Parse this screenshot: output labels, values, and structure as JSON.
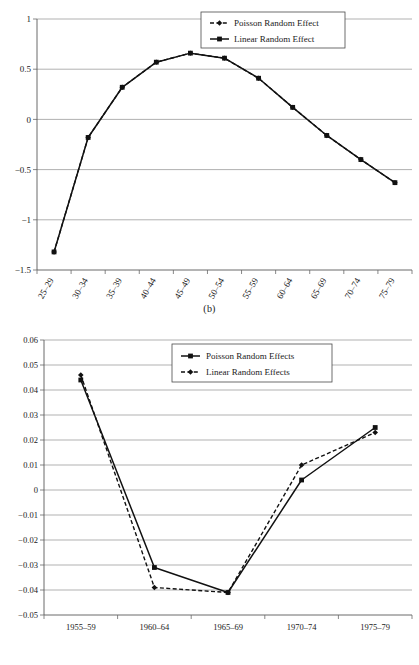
{
  "figures": [
    {
      "id": "b",
      "caption": "(b)",
      "legend": {
        "entries": [
          {
            "label": "Poisson Random Effect",
            "style": "dashed-diamond"
          },
          {
            "label": "Linear Random Effect",
            "style": "solid-square"
          }
        ]
      }
    },
    {
      "id": "c",
      "caption": "(c)",
      "legend": {
        "entries": [
          {
            "label": "Poisson Random Effects",
            "style": "solid-square"
          },
          {
            "label": "Linear Random Effects",
            "style": "dashed-diamond"
          }
        ]
      }
    }
  ],
  "chart_data": [
    {
      "type": "line",
      "id": "b",
      "title": "",
      "caption": "(b)",
      "xlabel": "",
      "ylabel": "",
      "categories": [
        "25–29",
        "30–34",
        "35–39",
        "40–44",
        "45–49",
        "50–54",
        "55–59",
        "60–64",
        "65–69",
        "70–74",
        "75–79"
      ],
      "ylim": [
        -1.5,
        1
      ],
      "yticks": [
        1,
        0.5,
        0,
        -0.5,
        -1,
        -1.5
      ],
      "ytick_labels": [
        "1",
        "0.5",
        "0",
        "−0.5",
        "−1",
        "−1.5"
      ],
      "grid": true,
      "legend_position": "top-right",
      "series": [
        {
          "name": "Poisson Random Effect",
          "marker": "diamond",
          "line": "dashed",
          "values": [
            -1.32,
            -0.18,
            0.32,
            0.57,
            0.66,
            0.61,
            0.41,
            0.12,
            -0.16,
            -0.4,
            -0.63
          ]
        },
        {
          "name": "Linear Random Effect",
          "marker": "square",
          "line": "solid",
          "values": [
            -1.32,
            -0.18,
            0.32,
            0.57,
            0.66,
            0.61,
            0.41,
            0.12,
            -0.16,
            -0.4,
            -0.63
          ]
        }
      ]
    },
    {
      "type": "line",
      "id": "c",
      "title": "",
      "caption": "(c)",
      "xlabel": "",
      "ylabel": "",
      "categories": [
        "1955–59",
        "1960–64",
        "1965–69",
        "1970–74",
        "1975–79"
      ],
      "ylim": [
        -0.05,
        0.06
      ],
      "yticks": [
        0.06,
        0.05,
        0.04,
        0.03,
        0.02,
        0.01,
        0,
        -0.01,
        -0.02,
        -0.03,
        -0.04,
        -0.05
      ],
      "ytick_labels": [
        "0.06",
        "0.05",
        "0.04",
        "0.03",
        "0.02",
        "0.01",
        "0",
        "−0.01",
        "−0.02",
        "−0.03",
        "−0.04",
        "−0.05"
      ],
      "grid": true,
      "legend_position": "top-right",
      "series": [
        {
          "name": "Poisson Random Effects",
          "marker": "square",
          "line": "solid",
          "values": [
            0.044,
            -0.031,
            -0.041,
            0.004,
            0.025
          ]
        },
        {
          "name": "Linear Random Effects",
          "marker": "diamond",
          "line": "dashed",
          "values": [
            0.046,
            -0.039,
            -0.041,
            0.01,
            0.023
          ]
        }
      ]
    }
  ]
}
